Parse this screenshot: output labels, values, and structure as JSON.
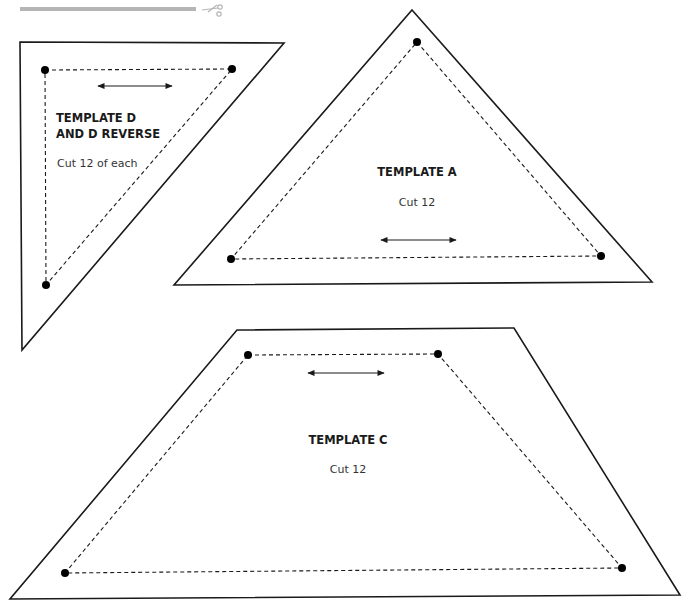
{
  "page": {
    "cut_guide": {
      "icon": "scissors-icon",
      "color": "#b5b5b5"
    },
    "templates": [
      {
        "id": "D",
        "title_line1": "TEMPLATE D",
        "title_line2": "AND D REVERSE",
        "instruction": "Cut 12 of each",
        "shape": "right-triangle",
        "grainline": "horizontal"
      },
      {
        "id": "A",
        "title_line1": "TEMPLATE A",
        "instruction": "Cut 12",
        "shape": "triangle",
        "grainline": "horizontal"
      },
      {
        "id": "C",
        "title_line1": "TEMPLATE C",
        "instruction": "Cut 12",
        "shape": "trapezoid",
        "grainline": "horizontal"
      }
    ]
  }
}
